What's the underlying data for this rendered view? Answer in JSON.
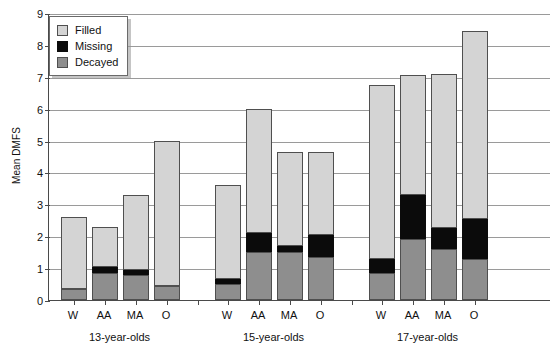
{
  "chart_data": {
    "type": "bar",
    "title": "",
    "subtitle": "",
    "xlabel": "",
    "ylabel": "Mean DMFS",
    "ylim": [
      0,
      9
    ],
    "yticks": [
      0,
      1,
      2,
      3,
      4,
      5,
      6,
      7,
      8,
      9
    ],
    "grid": true,
    "stacked": true,
    "legend_position": "top-left",
    "legend": [
      "Filled",
      "Missing",
      "Decayed"
    ],
    "colors": {
      "Filled": "#d4d4d4",
      "Missing": "#0b0b0b",
      "Decayed": "#8e8e8e",
      "axis": "#4a4a4a",
      "grid": "#9a9a9a",
      "background": "#ffffff"
    },
    "group_labels": [
      "13-year-olds",
      "15-year-olds",
      "17-year-olds"
    ],
    "categories": [
      "W",
      "AA",
      "MA",
      "O",
      "W",
      "AA",
      "MA",
      "O",
      "W",
      "AA",
      "MA",
      "O"
    ],
    "series": [
      {
        "name": "Decayed",
        "values": [
          0.35,
          0.85,
          0.8,
          0.45,
          0.5,
          1.5,
          1.5,
          1.35,
          0.85,
          1.9,
          1.6,
          1.3
        ]
      },
      {
        "name": "Missing",
        "values": [
          0.0,
          0.2,
          0.15,
          0.0,
          0.15,
          0.6,
          0.2,
          0.7,
          0.45,
          1.4,
          0.65,
          1.25
        ]
      },
      {
        "name": "Filled",
        "values": [
          2.25,
          1.25,
          2.35,
          4.55,
          2.95,
          3.9,
          2.95,
          2.6,
          5.45,
          3.75,
          4.85,
          5.9
        ]
      }
    ],
    "totals": [
      2.6,
      2.3,
      3.3,
      5.0,
      3.6,
      6.0,
      4.65,
      4.65,
      6.75,
      7.05,
      7.1,
      8.45
    ],
    "bars": [
      {
        "group": "13-year-olds",
        "category": "W",
        "decayed_top": 0.35,
        "missing_top": 0.35,
        "total": 2.6
      },
      {
        "group": "13-year-olds",
        "category": "AA",
        "decayed_top": 0.85,
        "missing_top": 1.05,
        "total": 2.3
      },
      {
        "group": "13-year-olds",
        "category": "MA",
        "decayed_top": 0.8,
        "missing_top": 0.95,
        "total": 3.3
      },
      {
        "group": "13-year-olds",
        "category": "O",
        "decayed_top": 0.45,
        "missing_top": 0.45,
        "total": 5.0
      },
      {
        "group": "15-year-olds",
        "category": "W",
        "decayed_top": 0.5,
        "missing_top": 0.65,
        "total": 3.6
      },
      {
        "group": "15-year-olds",
        "category": "AA",
        "decayed_top": 1.5,
        "missing_top": 2.1,
        "total": 6.0
      },
      {
        "group": "15-year-olds",
        "category": "MA",
        "decayed_top": 1.5,
        "missing_top": 1.7,
        "total": 4.65
      },
      {
        "group": "15-year-olds",
        "category": "O",
        "decayed_top": 1.35,
        "missing_top": 2.05,
        "total": 4.65
      },
      {
        "group": "17-year-olds",
        "category": "W",
        "decayed_top": 0.85,
        "missing_top": 1.3,
        "total": 6.75
      },
      {
        "group": "17-year-olds",
        "category": "AA",
        "decayed_top": 1.9,
        "missing_top": 3.3,
        "total": 7.05
      },
      {
        "group": "17-year-olds",
        "category": "MA",
        "decayed_top": 1.6,
        "missing_top": 2.25,
        "total": 7.1
      },
      {
        "group": "17-year-olds",
        "category": "O",
        "decayed_top": 1.3,
        "missing_top": 2.55,
        "total": 8.45
      }
    ]
  }
}
